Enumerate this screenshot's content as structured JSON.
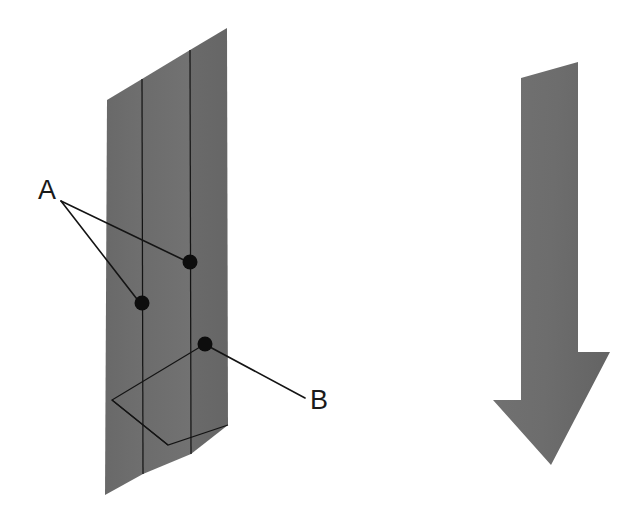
{
  "figure": {
    "background_color": "#ffffff",
    "width": 644,
    "height": 525
  },
  "colors": {
    "panel_gray": "#6a6a6a",
    "panel_gray_light": "#767676",
    "panel_gray_dark": "#636363",
    "arrow_gray": "#6d6d6d",
    "line_black": "#141414",
    "dot_black": "#0d0d0d",
    "label_black": "#1a1a1a"
  },
  "panel": {
    "name": "layered-panel",
    "outline_points": "107,100 227,28 228,425 105,495",
    "strip_left_points": "107,100 142,79 143,474 105,495",
    "strip_mid_points": "142,79 190,50 191,454 143,474",
    "strip_right_points": "190,50 227,28 228,425 191,454",
    "seam_lines": [
      {
        "name": "seam-line-1",
        "points": "142,79 143,474"
      },
      {
        "name": "seam-line-2",
        "points": "190,50 191,454"
      }
    ]
  },
  "bottom_feature": {
    "name": "delamination-outline",
    "polyline_points": "205,344 112,400 168,445 228,425",
    "inner_points": "112,400 168,445"
  },
  "markers": [
    {
      "name": "marker-a-lower",
      "cx": 142,
      "cy": 303,
      "r": 7.5,
      "label": "A"
    },
    {
      "name": "marker-a-upper",
      "cx": 190,
      "cy": 262,
      "r": 7.5,
      "label": "A"
    },
    {
      "name": "marker-b",
      "cx": 205,
      "cy": 344,
      "r": 7.5,
      "label": "B"
    }
  ],
  "leaders": [
    {
      "name": "leader-a-to-upper",
      "points": "61,201 188,262"
    },
    {
      "name": "leader-a-to-lower",
      "points": "61,201 140,303"
    },
    {
      "name": "leader-b",
      "points": "208,346 305,398"
    }
  ],
  "labels": [
    {
      "name": "label-a",
      "text": "A",
      "x": 38,
      "y": 199
    },
    {
      "name": "label-b",
      "text": "B",
      "x": 310,
      "y": 409
    }
  ],
  "arrow": {
    "name": "direction-arrow",
    "points": "521,78 578,62 578,352 610,352 551,465 493,400 521,400",
    "direction": "down"
  }
}
